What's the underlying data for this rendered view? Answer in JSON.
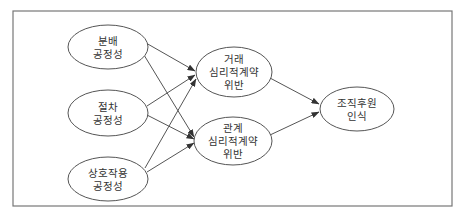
{
  "diagram": {
    "type": "path-model",
    "colors": {
      "stroke": "#555555",
      "frame": "#777777",
      "text": "#333333",
      "background": "#ffffff"
    },
    "nodes": [
      {
        "id": "distributive",
        "lines": [
          "분배",
          "공정성"
        ],
        "cx": 108,
        "cy": 47,
        "rx": 40,
        "ry": 22
      },
      {
        "id": "procedural",
        "lines": [
          "절차",
          "공정성"
        ],
        "cx": 108,
        "cy": 113,
        "rx": 40,
        "ry": 23
      },
      {
        "id": "interactional",
        "lines": [
          "상호작용",
          "공정성"
        ],
        "cx": 108,
        "cy": 179,
        "rx": 40,
        "ry": 22
      },
      {
        "id": "transactional-breach",
        "lines": [
          "거래",
          "심리적계약",
          "위반"
        ],
        "cx": 234,
        "cy": 72,
        "rx": 38,
        "ry": 25
      },
      {
        "id": "relational-breach",
        "lines": [
          "관계",
          "심리적계약",
          "위반"
        ],
        "cx": 233,
        "cy": 141,
        "rx": 39,
        "ry": 24
      },
      {
        "id": "pos",
        "lines": [
          "조직후원",
          "인식"
        ],
        "cx": 357,
        "cy": 109,
        "rx": 37,
        "ry": 22
      }
    ],
    "edges": [
      {
        "from": "distributive",
        "to": "transactional-breach",
        "x1": 146,
        "y1": 43,
        "x2": 195,
        "y2": 71
      },
      {
        "from": "distributive",
        "to": "relational-breach",
        "x1": 144,
        "y1": 55,
        "x2": 194,
        "y2": 137
      },
      {
        "from": "procedural",
        "to": "transactional-breach",
        "x1": 147,
        "y1": 106,
        "x2": 195,
        "y2": 75
      },
      {
        "from": "procedural",
        "to": "relational-breach",
        "x1": 147,
        "y1": 115,
        "x2": 194,
        "y2": 139
      },
      {
        "from": "interactional",
        "to": "transactional-breach",
        "x1": 145,
        "y1": 168,
        "x2": 196,
        "y2": 79
      },
      {
        "from": "interactional",
        "to": "relational-breach",
        "x1": 147,
        "y1": 172,
        "x2": 194,
        "y2": 143
      },
      {
        "from": "transactional-breach",
        "to": "pos",
        "x1": 270,
        "y1": 78,
        "x2": 319,
        "y2": 104
      },
      {
        "from": "relational-breach",
        "to": "pos",
        "x1": 270,
        "y1": 135,
        "x2": 319,
        "y2": 112
      }
    ],
    "frame": {
      "x": 13,
      "y": 11,
      "width": 439,
      "height": 195
    }
  }
}
